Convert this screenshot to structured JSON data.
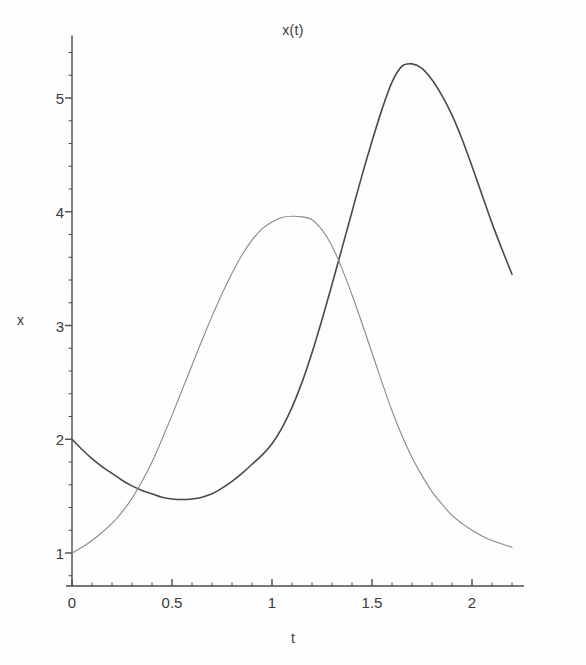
{
  "chart_data": {
    "type": "line",
    "title": "x(t)",
    "xlabel": "t",
    "ylabel": "x",
    "xlim": [
      -0.02,
      2.26
    ],
    "ylim": [
      0.78,
      5.55
    ],
    "xticks": [
      0,
      0.5,
      1,
      1.5,
      2
    ],
    "xtick_labels": [
      "0",
      "0.5",
      "1",
      "1.5",
      "2"
    ],
    "yticks": [
      1,
      2,
      3,
      4,
      5
    ],
    "ytick_labels": [
      "1",
      "2",
      "3",
      "4",
      "5"
    ],
    "minor_xtick_step": 0.1,
    "minor_ytick_step": 0.2,
    "grid": false,
    "legend": "none",
    "axis_color": "#4a4a4a",
    "series": [
      {
        "name": "dark-curve",
        "color": "#4a4a4a",
        "width": 1.6,
        "x": [
          0.0,
          0.05,
          0.1,
          0.15,
          0.2,
          0.25,
          0.3,
          0.35,
          0.4,
          0.45,
          0.5,
          0.55,
          0.6,
          0.65,
          0.7,
          0.75,
          0.8,
          0.85,
          0.9,
          0.95,
          1.0,
          1.05,
          1.1,
          1.15,
          1.2,
          1.25,
          1.3,
          1.35,
          1.4,
          1.45,
          1.5,
          1.55,
          1.6,
          1.65,
          1.7,
          1.75,
          1.8,
          1.85,
          1.9,
          1.95,
          2.0,
          2.05,
          2.1,
          2.15,
          2.2
        ],
        "y": [
          2.0,
          1.91,
          1.83,
          1.76,
          1.7,
          1.64,
          1.59,
          1.55,
          1.52,
          1.49,
          1.475,
          1.47,
          1.475,
          1.49,
          1.52,
          1.57,
          1.63,
          1.7,
          1.78,
          1.86,
          1.96,
          2.1,
          2.28,
          2.5,
          2.76,
          3.05,
          3.36,
          3.68,
          4.0,
          4.32,
          4.62,
          4.9,
          5.14,
          5.28,
          5.3,
          5.26,
          5.16,
          5.02,
          4.85,
          4.64,
          4.4,
          4.15,
          3.9,
          3.67,
          3.45
        ]
      },
      {
        "name": "light-curve",
        "color": "#8a8a8a",
        "width": 1.1,
        "x": [
          0.0,
          0.05,
          0.1,
          0.15,
          0.2,
          0.25,
          0.3,
          0.35,
          0.4,
          0.45,
          0.5,
          0.55,
          0.6,
          0.65,
          0.7,
          0.75,
          0.8,
          0.85,
          0.9,
          0.95,
          1.0,
          1.05,
          1.1,
          1.15,
          1.2,
          1.25,
          1.3,
          1.35,
          1.4,
          1.45,
          1.5,
          1.55,
          1.6,
          1.65,
          1.7,
          1.75,
          1.8,
          1.85,
          1.9,
          1.95,
          2.0,
          2.05,
          2.1,
          2.15,
          2.2
        ],
        "y": [
          1.0,
          1.05,
          1.11,
          1.18,
          1.26,
          1.36,
          1.48,
          1.63,
          1.8,
          2.0,
          2.21,
          2.43,
          2.65,
          2.87,
          3.08,
          3.28,
          3.46,
          3.62,
          3.75,
          3.85,
          3.91,
          3.95,
          3.96,
          3.955,
          3.93,
          3.84,
          3.7,
          3.5,
          3.27,
          3.02,
          2.76,
          2.5,
          2.25,
          2.03,
          1.84,
          1.68,
          1.54,
          1.43,
          1.33,
          1.26,
          1.2,
          1.15,
          1.11,
          1.08,
          1.05
        ]
      }
    ],
    "annotations": []
  }
}
